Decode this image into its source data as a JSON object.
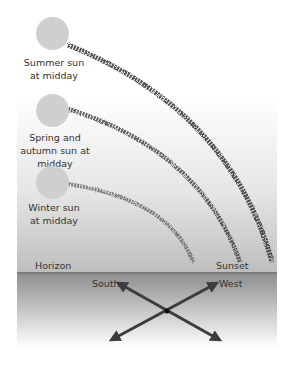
{
  "suns": [
    {
      "id": "summer",
      "label_line1": "Summer sun",
      "label_line2": "at midday"
    },
    {
      "id": "spring-autumn",
      "label_line1": "Spring and",
      "label_line2": "autumn sun at",
      "label_line3": "midday"
    },
    {
      "id": "winter",
      "label_line1": "Winter sun",
      "label_line2": "at midday"
    }
  ],
  "labels": {
    "horizon": "Horizon",
    "sunset": "Sunset",
    "south": "South",
    "west": "West"
  },
  "colors": {
    "sun": "#cfcfcf",
    "path": "#3a3a3a",
    "arrow": "#3c3c3c",
    "ground": "#8e8e8e"
  }
}
